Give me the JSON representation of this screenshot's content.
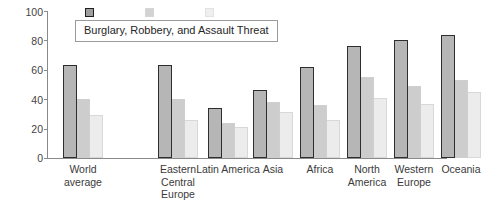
{
  "chart_data": {
    "type": "bar",
    "title": "Burglary, Robbery, and Assault Threat",
    "xlabel": "",
    "ylabel": "",
    "ylim": [
      0,
      100
    ],
    "yticks": [
      0,
      20,
      40,
      60,
      80,
      100
    ],
    "grid": false,
    "legend_position": "top-center",
    "categories": [
      "World average",
      "Eastern Central Europe",
      "Latin America",
      "Asia",
      "Africa",
      "North America",
      "Western Europe",
      "Oceania"
    ],
    "series": [
      {
        "name": "Burglary",
        "color": "#b6b6b6",
        "values": [
          63,
          63,
          34,
          46,
          62,
          76,
          80,
          84
        ]
      },
      {
        "name": "Robbery",
        "color": "#cdcdcd",
        "values": [
          40,
          40,
          24,
          38,
          36,
          55,
          49,
          53
        ]
      },
      {
        "name": "Assault",
        "color": "#ececec",
        "values": [
          29,
          26,
          21,
          31,
          26,
          41,
          37,
          45
        ]
      }
    ]
  },
  "axis": {
    "y_tick_labels": [
      "100",
      "80",
      "60",
      "40",
      "20",
      "0"
    ]
  },
  "legend": {
    "title": "Burglary, Robbery, and Assault Threat",
    "swatch_names": [
      "burglary-swatch",
      "robbery-swatch",
      "assault-swatch"
    ]
  }
}
